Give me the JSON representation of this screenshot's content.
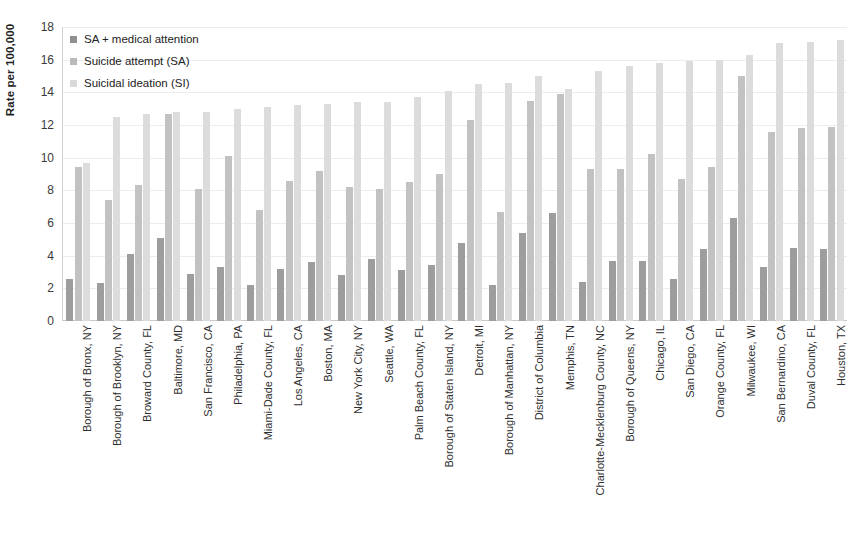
{
  "chart_data": {
    "type": "bar",
    "title": "",
    "xlabel": "",
    "ylabel": "Rate per 100,000",
    "ylim": [
      0,
      18
    ],
    "ytick_step": 2,
    "yticks": [
      18,
      16,
      14,
      12,
      10,
      8,
      6,
      4,
      2,
      0
    ],
    "grid": true,
    "legend_position": "top-left",
    "categories": [
      "Borough of Bronx, NY",
      "Borough of Brooklyn, NY",
      "Broward County, FL",
      "Baltimore, MD",
      "San Francisco, CA",
      "Philadelphia, PA",
      "Miami-Dade County, FL",
      "Los Angeles, CA",
      "Boston, MA",
      "New York City, NY",
      "Seattle, WA",
      "Palm Beach County, FL",
      "Borough of Staten Island, NY",
      "Detroit, MI",
      "Borough of Manhattan, NY",
      "District of Columbia",
      "Memphis, TN",
      "Charlotte-Mecklenburg County, NC",
      "Borough of Queens, NY",
      "Chicago, IL",
      "San Diego, CA",
      "Orange County, FL",
      "Milwaukee, WI",
      "San Bernardino, CA",
      "Duval County, FL",
      "Houston, TX"
    ],
    "series": [
      {
        "name": "SA + medical attention",
        "color": "#9d9d9d",
        "values": [
          2.6,
          2.3,
          4.1,
          5.1,
          2.9,
          3.3,
          2.2,
          3.2,
          3.6,
          2.8,
          3.8,
          3.1,
          3.4,
          4.8,
          2.2,
          5.4,
          6.6,
          2.4,
          3.7,
          3.7,
          2.6,
          4.4,
          6.3,
          3.3,
          4.5,
          4.4
        ]
      },
      {
        "name": "Suicide attempt (SA)",
        "color": "#c2c2c2",
        "values": [
          9.4,
          7.4,
          8.3,
          12.7,
          8.1,
          10.1,
          6.8,
          8.6,
          9.2,
          8.2,
          8.1,
          8.5,
          9.0,
          12.3,
          6.7,
          13.5,
          13.9,
          9.3,
          9.3,
          10.2,
          8.7,
          9.4,
          15.0,
          11.6,
          11.8,
          11.9
        ]
      },
      {
        "name": "Suicidal ideation (SI)",
        "color": "#dcdcdc",
        "values": [
          9.7,
          12.5,
          12.7,
          12.8,
          12.8,
          13.0,
          13.1,
          13.2,
          13.3,
          13.4,
          13.4,
          13.7,
          14.1,
          14.5,
          14.6,
          15.0,
          14.2,
          15.3,
          15.6,
          15.8,
          15.9,
          16.0,
          16.3,
          17.0,
          17.1,
          17.2
        ]
      }
    ]
  },
  "legend": {
    "items": [
      {
        "label": "SA + medical attention"
      },
      {
        "label": "Suicide attempt (SA)"
      },
      {
        "label": "Suicidal ideation (SI)"
      }
    ]
  }
}
